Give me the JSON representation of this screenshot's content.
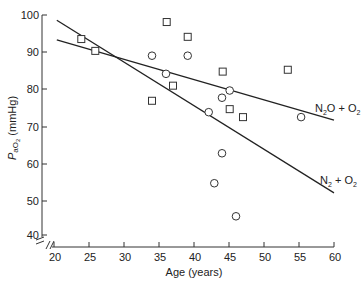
{
  "chart_data": {
    "type": "scatter",
    "title": "",
    "xlabel": "Age (years)",
    "ylabel": "PaO2 (mmHg)",
    "ylabel_parts": {
      "main": "P",
      "sub": "aO",
      "sub2": "2",
      "unit": " (mmHg)"
    },
    "xlim": [
      20,
      60
    ],
    "ylim": [
      40,
      100
    ],
    "axis_break": true,
    "grid": false,
    "x_ticks": [
      20,
      25,
      30,
      35,
      40,
      45,
      50,
      55,
      60
    ],
    "y_ticks": [
      40,
      50,
      60,
      70,
      80,
      90,
      100
    ],
    "series": [
      {
        "name": "N2O + O2",
        "label_parts": {
          "a": "N",
          "a_sub": "2",
          "b": "O + O",
          "b_sub": "2"
        },
        "marker": "square",
        "points": [
          [
            23.9,
            93.5
          ],
          [
            25.9,
            90.3
          ],
          [
            36.1,
            98.1
          ],
          [
            39.1,
            94.1
          ],
          [
            37.0,
            80.9
          ],
          [
            34.0,
            76.9
          ],
          [
            44.1,
            84.7
          ],
          [
            53.4,
            85.2
          ],
          [
            45.1,
            74.7
          ],
          [
            47.0,
            72.6
          ]
        ],
        "regression_line": [
          [
            20.4,
            93.3
          ],
          [
            60,
            71.8
          ]
        ]
      },
      {
        "name": "N2 + O2",
        "label_parts": {
          "a": "N",
          "a_sub": "2",
          "b": " + O",
          "b_sub": "2"
        },
        "marker": "circle",
        "points": [
          [
            34.0,
            89.0
          ],
          [
            39.1,
            89.0
          ],
          [
            36.0,
            84.1
          ],
          [
            45.1,
            79.6
          ],
          [
            44.0,
            77.7
          ],
          [
            42.1,
            73.9
          ],
          [
            55.3,
            72.6
          ],
          [
            44.0,
            62.9
          ],
          [
            42.9,
            54.8
          ],
          [
            46.0,
            45.5
          ]
        ],
        "regression_line": [
          [
            20.4,
            98.6
          ],
          [
            60,
            52.2
          ]
        ]
      }
    ]
  }
}
